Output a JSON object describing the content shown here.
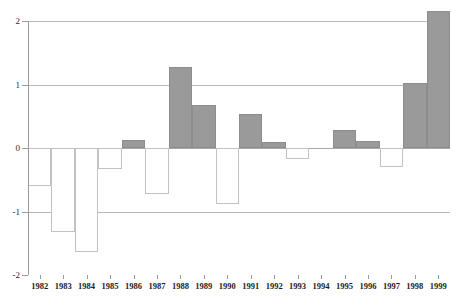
{
  "chart_data": {
    "type": "bar",
    "title": "",
    "subtitle": "",
    "xlabel": "",
    "ylabel": "",
    "categories": [
      "1982",
      "1983",
      "1984",
      "1985",
      "1986",
      "1987",
      "1988",
      "1989",
      "1990",
      "1991",
      "1992",
      "1993",
      "1994",
      "1995",
      "1996",
      "1997",
      "1998",
      "1999"
    ],
    "values": [
      -0.6,
      -1.32,
      -1.63,
      -0.33,
      0.13,
      -0.72,
      1.27,
      0.68,
      -0.88,
      0.53,
      0.1,
      -0.17,
      0.0,
      0.28,
      0.11,
      -0.3,
      1.02,
      2.15
    ],
    "ylim": [
      -2,
      2
    ],
    "yticks": [
      -2,
      -1,
      0,
      1,
      2
    ],
    "ytick_labels": [
      "-2",
      "-1",
      "0",
      "1",
      "2"
    ],
    "grid": true,
    "gridlines_at": [
      2,
      1,
      0,
      -1,
      -2
    ],
    "legend": null,
    "legend_position": "none",
    "series": [
      {
        "name": "",
        "values": [
          -0.6,
          -1.32,
          -1.63,
          -0.33,
          0.13,
          -0.72,
          1.27,
          0.68,
          -0.88,
          0.53,
          0.1,
          -0.17,
          0.0,
          0.28,
          0.11,
          -0.3,
          1.02,
          2.15
        ]
      }
    ],
    "colors": {
      "positive_bar_fill": "#9a9a9a",
      "positive_bar_stroke": "#8d8d8d",
      "negative_bar_fill": "#ffffff",
      "negative_bar_stroke": "#c2c2c2",
      "gridline": "#b9b9b9",
      "zero_line": "#a8a8a8",
      "axis": "#9a9a9a",
      "tick_text": "#1c1c1c",
      "background": "#ffffff"
    }
  }
}
